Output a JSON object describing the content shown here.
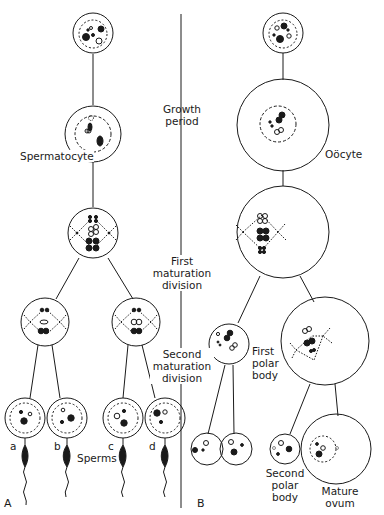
{
  "diagram": {
    "type": "gametogenesis-comparison",
    "panels": [
      {
        "id": "A",
        "label": "A",
        "subject": "Spermatogenesis"
      },
      {
        "id": "B",
        "label": "B",
        "subject": "Oogenesis"
      }
    ],
    "stage_labels": {
      "growth": [
        "Growth",
        "period"
      ],
      "first_division": [
        "First",
        "maturation",
        "division"
      ],
      "second_division": [
        "Second",
        "maturation",
        "division"
      ]
    },
    "left": {
      "spermatocyte": "Spermatocyte",
      "spermatids": [
        "a",
        "b",
        "c",
        "d"
      ],
      "sperms": "Sperms"
    },
    "right": {
      "oocyte": "Oöcyte",
      "first_polar_body": [
        "First",
        "polar",
        "body"
      ],
      "second_polar_body": [
        "Second",
        "polar",
        "body"
      ],
      "mature_ovum": [
        "Mature",
        "ovum"
      ]
    },
    "colors": {
      "ink": "#1a1a1a",
      "background": "#ffffff"
    }
  }
}
